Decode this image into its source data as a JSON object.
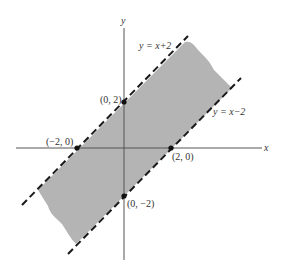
{
  "figure": {
    "axes": {
      "x_label": "x",
      "y_label": "y"
    },
    "lines": [
      {
        "equation_label": "y = x+2",
        "style": "dashed"
      },
      {
        "equation_label": "y = x−2",
        "style": "dashed"
      }
    ],
    "points": [
      {
        "label": "(0, 2)"
      },
      {
        "label": "(−2, 0)"
      },
      {
        "label": "(2, 0)"
      },
      {
        "label": "(0, −2)"
      }
    ],
    "shaded_region": "region between y = x−2 and y = x+2",
    "colors": {
      "shade": "#b4b4b4",
      "line": "#1a1a1a",
      "axis": "#555555"
    }
  }
}
